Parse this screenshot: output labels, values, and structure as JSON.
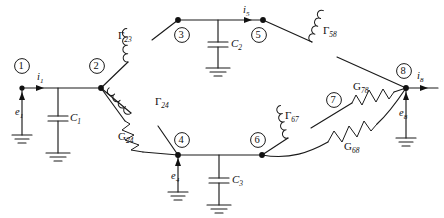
{
  "figure": {
    "kind": "electrical-network-diagram",
    "width": 444,
    "height": 218,
    "stroke_color": "#1a1a1a",
    "background_color": "#ffffff"
  },
  "nodes": [
    {
      "id": "1",
      "label": "1",
      "x": 22,
      "y": 88,
      "ring_x": 22,
      "ring_y": 66
    },
    {
      "id": "2",
      "label": "2",
      "x": 101,
      "y": 88,
      "ring_x": 97,
      "ring_y": 66
    },
    {
      "id": "3",
      "label": "3",
      "x": 178,
      "y": 20,
      "ring_x": 182,
      "ring_y": 35
    },
    {
      "id": "4",
      "label": "4",
      "x": 178,
      "y": 155,
      "ring_x": 182,
      "ring_y": 140
    },
    {
      "id": "5",
      "label": "5",
      "x": 263,
      "y": 20,
      "ring_x": 259,
      "ring_y": 35
    },
    {
      "id": "6",
      "label": "6",
      "x": 262,
      "y": 155,
      "ring_x": 258,
      "ring_y": 140
    },
    {
      "id": "7",
      "label": "7",
      "x": 334,
      "y": 100,
      "ring_x": 334,
      "ring_y": 100
    },
    {
      "id": "8",
      "label": "8",
      "x": 406,
      "y": 88,
      "ring_x": 404,
      "ring_y": 71
    }
  ],
  "components": [
    {
      "id": "G23",
      "symbol": "inductor",
      "label_greek": "Γ",
      "label_sub": "23",
      "between": [
        "2",
        "3"
      ]
    },
    {
      "id": "G24",
      "symbol": "inductor",
      "label_greek": "Γ",
      "label_sub": "24",
      "between": [
        "2",
        "4"
      ]
    },
    {
      "id": "R24",
      "symbol": "resistor",
      "label_greek": "G",
      "label_sub": "24",
      "between": [
        "2",
        "4"
      ]
    },
    {
      "id": "G58",
      "symbol": "inductor",
      "label_greek": "Γ",
      "label_sub": "58",
      "between": [
        "5",
        "8"
      ]
    },
    {
      "id": "G67",
      "symbol": "inductor",
      "label_greek": "Γ",
      "label_sub": "67",
      "between": [
        "6",
        "7"
      ]
    },
    {
      "id": "R78",
      "symbol": "resistor",
      "label_greek": "G",
      "label_sub": "78",
      "between": [
        "7",
        "8"
      ]
    },
    {
      "id": "R68",
      "symbol": "resistor",
      "label_greek": "G",
      "label_sub": "68",
      "between": [
        "6",
        "8"
      ]
    },
    {
      "id": "C1",
      "symbol": "capacitor",
      "label_greek": "C",
      "label_sub": "1",
      "between": [
        "1",
        "ground"
      ]
    },
    {
      "id": "C2",
      "symbol": "capacitor",
      "label_greek": "C",
      "label_sub": "2",
      "between": [
        "3",
        "ground"
      ]
    },
    {
      "id": "C3",
      "symbol": "capacitor",
      "label_greek": "C",
      "label_sub": "3",
      "between": [
        "4",
        "ground"
      ]
    }
  ],
  "sources": [
    {
      "id": "e1",
      "label_base": "e",
      "label_sub": "1",
      "at_node": "1",
      "direction": "up"
    },
    {
      "id": "e4",
      "label_base": "e",
      "label_sub": "4",
      "at_node": "4",
      "direction": "up"
    },
    {
      "id": "e8",
      "label_base": "e",
      "label_sub": "8",
      "at_node": "8",
      "direction": "up"
    }
  ],
  "currents": [
    {
      "id": "i1",
      "label_base": "i",
      "label_sub": "1",
      "at_node": "1",
      "direction": "right"
    },
    {
      "id": "i5",
      "label_base": "i",
      "label_sub": "5",
      "at_node": "5",
      "direction": "right"
    },
    {
      "id": "i8",
      "label_base": "i",
      "label_sub": "8",
      "at_node": "8",
      "direction": "right"
    }
  ],
  "labels": {
    "node_1": "1",
    "node_2": "2",
    "node_3": "3",
    "node_4": "4",
    "node_5": "5",
    "node_6": "6",
    "node_7": "7",
    "node_8": "8",
    "gamma_23_base": "Γ",
    "gamma_23_sub": "23",
    "gamma_24_base": "Γ",
    "gamma_24_sub": "24",
    "gamma_58_base": "Γ",
    "gamma_58_sub": "58",
    "gamma_67_base": "Γ",
    "gamma_67_sub": "67",
    "g_24_base": "G",
    "g_24_sub": "24",
    "g_78_base": "G",
    "g_78_sub": "78",
    "g_68_base": "G",
    "g_68_sub": "68",
    "c_1_base": "C",
    "c_1_sub": "1",
    "c_2_base": "C",
    "c_2_sub": "2",
    "c_3_base": "C",
    "c_3_sub": "3",
    "e_1_base": "e",
    "e_1_sub": "1",
    "e_4_base": "e",
    "e_4_sub": "4",
    "e_8_base": "e",
    "e_8_sub": "8",
    "i_1_base": "i",
    "i_1_sub": "1",
    "i_5_base": "i",
    "i_5_sub": "5",
    "i_8_base": "i",
    "i_8_sub": "8"
  }
}
